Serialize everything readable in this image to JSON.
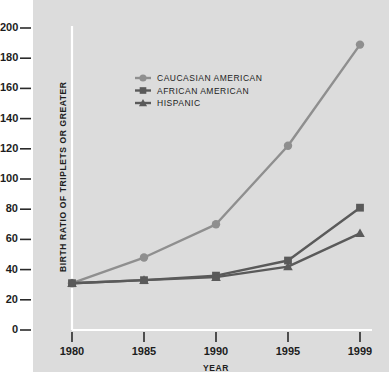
{
  "chart_data": {
    "type": "line",
    "title": "",
    "subtitle": "",
    "xlabel": "YEAR",
    "ylabel": "BIRTH RATIO OF TRIPLETS OR GREATER",
    "categories": [
      "1980",
      "1985",
      "1990",
      "1995",
      "1999"
    ],
    "x": [
      1980,
      1985,
      1990,
      1995,
      1999
    ],
    "xlim": [
      1980,
      1999
    ],
    "ylim": [
      0,
      200
    ],
    "yticks": [
      0,
      20,
      40,
      60,
      80,
      100,
      120,
      140,
      160,
      180,
      200
    ],
    "ytick_labels": [
      "0",
      "20",
      "40",
      "60",
      "80",
      "100",
      "120",
      "140",
      "160",
      "180",
      "200"
    ],
    "xtick_labels": [
      "1980",
      "1985",
      "1990",
      "1995",
      "1999"
    ],
    "grid": false,
    "legend_position": "upper-left-inside",
    "series": [
      {
        "name": "CAUCASIAN AMERICAN",
        "marker": "circle",
        "color": "#8f8f8f",
        "values": [
          31,
          48,
          70,
          122,
          189
        ]
      },
      {
        "name": "AFRICAN AMERICAN",
        "marker": "square",
        "color": "#5a5a5a",
        "values": [
          31,
          33,
          36,
          46,
          81
        ]
      },
      {
        "name": "HISPANIC",
        "marker": "triangle",
        "color": "#5a5a5a",
        "values": [
          31,
          33,
          35,
          42,
          64
        ]
      }
    ]
  },
  "style": {
    "panel_background": "#dcdcdc",
    "page_background": "#ffffff",
    "axis_line_color": "#ffffff",
    "tick_color": "#2a2a2a",
    "text_color": "#1d1d1d"
  },
  "legend": {
    "entries": [
      {
        "label": "CAUCASIAN AMERICAN",
        "marker": "circle-marker-icon",
        "color": "#8f8f8f"
      },
      {
        "label": "AFRICAN AMERICAN",
        "marker": "square-marker-icon",
        "color": "#5a5a5a"
      },
      {
        "label": "HISPANIC",
        "marker": "triangle-marker-icon",
        "color": "#5a5a5a"
      }
    ]
  },
  "axes": {
    "y_title": "BIRTH RATIO OF TRIPLETS OR GREATER",
    "x_title": "YEAR"
  }
}
